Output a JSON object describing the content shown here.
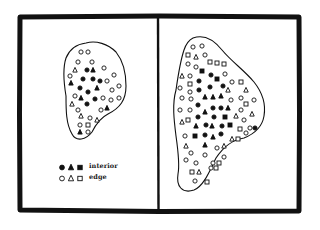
{
  "figure": {
    "frame": {
      "outer": {
        "x": 20,
        "y": 16,
        "w": 279,
        "h": 195
      },
      "divider_x": 158,
      "stroke": "#111111",
      "stroke_width": 5
    },
    "panels": [
      {
        "id": "left",
        "blob_path": "M86,43 C96,40 108,44 116,52 C124,62 126,74 126,86 C126,100 120,108 108,114 C100,118 96,124 92,132 C86,140 76,142 72,134 C66,124 66,110 66,96 C64,84 62,70 66,58 C70,48 78,44 86,43 Z",
        "markers": [
          {
            "x": 81,
            "y": 52,
            "shape": "circle",
            "fill": false
          },
          {
            "x": 88,
            "y": 52,
            "shape": "circle",
            "fill": false
          },
          {
            "x": 78,
            "y": 62,
            "shape": "circle",
            "fill": false
          },
          {
            "x": 92,
            "y": 62,
            "shape": "circle",
            "fill": false
          },
          {
            "x": 75,
            "y": 70,
            "shape": "triangle",
            "fill": false
          },
          {
            "x": 87,
            "y": 70,
            "shape": "circle",
            "fill": true
          },
          {
            "x": 93,
            "y": 70,
            "shape": "triangle",
            "fill": true
          },
          {
            "x": 104,
            "y": 68,
            "shape": "circle",
            "fill": false
          },
          {
            "x": 70,
            "y": 76,
            "shape": "circle",
            "fill": false
          },
          {
            "x": 83,
            "y": 79,
            "shape": "circle",
            "fill": true
          },
          {
            "x": 93,
            "y": 79,
            "shape": "circle",
            "fill": true
          },
          {
            "x": 100,
            "y": 81,
            "shape": "circle",
            "fill": true
          },
          {
            "x": 107,
            "y": 81,
            "shape": "circle",
            "fill": false
          },
          {
            "x": 114,
            "y": 75,
            "shape": "circle",
            "fill": false
          },
          {
            "x": 71,
            "y": 83,
            "shape": "triangle",
            "fill": true
          },
          {
            "x": 80,
            "y": 88,
            "shape": "circle",
            "fill": true
          },
          {
            "x": 97,
            "y": 88,
            "shape": "triangle",
            "fill": true
          },
          {
            "x": 112,
            "y": 90,
            "shape": "circle",
            "fill": false
          },
          {
            "x": 119,
            "y": 86,
            "shape": "circle",
            "fill": false
          },
          {
            "x": 88,
            "y": 92,
            "shape": "circle",
            "fill": true
          },
          {
            "x": 75,
            "y": 96,
            "shape": "circle",
            "fill": false
          },
          {
            "x": 81,
            "y": 98,
            "shape": "triangle",
            "fill": true
          },
          {
            "x": 95,
            "y": 99,
            "shape": "circle",
            "fill": true
          },
          {
            "x": 103,
            "y": 98,
            "shape": "circle",
            "fill": false
          },
          {
            "x": 111,
            "y": 100,
            "shape": "circle",
            "fill": false
          },
          {
            "x": 119,
            "y": 98,
            "shape": "circle",
            "fill": false
          },
          {
            "x": 72,
            "y": 104,
            "shape": "triangle",
            "fill": false
          },
          {
            "x": 87,
            "y": 104,
            "shape": "circle",
            "fill": true
          },
          {
            "x": 78,
            "y": 110,
            "shape": "circle",
            "fill": false
          },
          {
            "x": 101,
            "y": 110,
            "shape": "circle",
            "fill": false
          },
          {
            "x": 107,
            "y": 108,
            "shape": "triangle",
            "fill": true
          },
          {
            "x": 81,
            "y": 116,
            "shape": "triangle",
            "fill": false
          },
          {
            "x": 90,
            "y": 118,
            "shape": "circle",
            "fill": false
          },
          {
            "x": 97,
            "y": 120,
            "shape": "triangle",
            "fill": false
          },
          {
            "x": 80,
            "y": 125,
            "shape": "circle",
            "fill": false
          },
          {
            "x": 88,
            "y": 125,
            "shape": "square",
            "fill": false
          },
          {
            "x": 80,
            "y": 132,
            "shape": "triangle",
            "fill": true
          },
          {
            "x": 88,
            "y": 132,
            "shape": "circle",
            "fill": false
          }
        ]
      },
      {
        "id": "right",
        "blob_path": "M193,38 C204,34 214,40 222,50 C232,62 244,70 254,82 C262,92 266,104 264,116 C262,128 254,134 244,138 C232,140 224,146 216,158 C210,170 204,186 194,190 C182,194 176,186 178,174 C180,164 178,150 176,136 C174,120 172,104 176,90 C178,76 180,62 184,50 C186,44 189,40 193,38 Z",
        "markers": [
          {
            "x": 193,
            "y": 47,
            "shape": "circle",
            "fill": false
          },
          {
            "x": 202,
            "y": 46,
            "shape": "circle",
            "fill": false
          },
          {
            "x": 188,
            "y": 55,
            "shape": "square",
            "fill": false
          },
          {
            "x": 196,
            "y": 57,
            "shape": "triangle",
            "fill": false
          },
          {
            "x": 205,
            "y": 55,
            "shape": "circle",
            "fill": false
          },
          {
            "x": 188,
            "y": 64,
            "shape": "circle",
            "fill": false
          },
          {
            "x": 196,
            "y": 67,
            "shape": "circle",
            "fill": false
          },
          {
            "x": 210,
            "y": 62,
            "shape": "square",
            "fill": false
          },
          {
            "x": 217,
            "y": 63,
            "shape": "square",
            "fill": false
          },
          {
            "x": 224,
            "y": 64,
            "shape": "square",
            "fill": false
          },
          {
            "x": 182,
            "y": 76,
            "shape": "triangle",
            "fill": false
          },
          {
            "x": 190,
            "y": 76,
            "shape": "circle",
            "fill": false
          },
          {
            "x": 202,
            "y": 71,
            "shape": "square",
            "fill": true
          },
          {
            "x": 211,
            "y": 75,
            "shape": "circle",
            "fill": true
          },
          {
            "x": 217,
            "y": 79,
            "shape": "square",
            "fill": true
          },
          {
            "x": 225,
            "y": 74,
            "shape": "circle",
            "fill": false
          },
          {
            "x": 180,
            "y": 88,
            "shape": "circle",
            "fill": false
          },
          {
            "x": 190,
            "y": 84,
            "shape": "square",
            "fill": false
          },
          {
            "x": 199,
            "y": 81,
            "shape": "circle",
            "fill": true
          },
          {
            "x": 210,
            "y": 87,
            "shape": "circle",
            "fill": true
          },
          {
            "x": 223,
            "y": 86,
            "shape": "circle",
            "fill": true
          },
          {
            "x": 232,
            "y": 82,
            "shape": "circle",
            "fill": false
          },
          {
            "x": 241,
            "y": 82,
            "shape": "square",
            "fill": false
          },
          {
            "x": 190,
            "y": 92,
            "shape": "circle",
            "fill": false
          },
          {
            "x": 199,
            "y": 90,
            "shape": "circle",
            "fill": true
          },
          {
            "x": 228,
            "y": 90,
            "shape": "triangle",
            "fill": false
          },
          {
            "x": 246,
            "y": 90,
            "shape": "triangle",
            "fill": false
          },
          {
            "x": 182,
            "y": 98,
            "shape": "circle",
            "fill": false
          },
          {
            "x": 191,
            "y": 99,
            "shape": "circle",
            "fill": false
          },
          {
            "x": 205,
            "y": 97,
            "shape": "triangle",
            "fill": true
          },
          {
            "x": 213,
            "y": 97,
            "shape": "triangle",
            "fill": true
          },
          {
            "x": 221,
            "y": 96,
            "shape": "triangle",
            "fill": true
          },
          {
            "x": 231,
            "y": 100,
            "shape": "circle",
            "fill": false
          },
          {
            "x": 241,
            "y": 98,
            "shape": "circle",
            "fill": false
          },
          {
            "x": 254,
            "y": 100,
            "shape": "circle",
            "fill": false
          },
          {
            "x": 198,
            "y": 105,
            "shape": "circle",
            "fill": true
          },
          {
            "x": 246,
            "y": 104,
            "shape": "square",
            "fill": false
          },
          {
            "x": 180,
            "y": 110,
            "shape": "circle",
            "fill": false
          },
          {
            "x": 190,
            "y": 110,
            "shape": "circle",
            "fill": false
          },
          {
            "x": 205,
            "y": 112,
            "shape": "triangle",
            "fill": true
          },
          {
            "x": 213,
            "y": 108,
            "shape": "circle",
            "fill": true
          },
          {
            "x": 221,
            "y": 108,
            "shape": "circle",
            "fill": true
          },
          {
            "x": 228,
            "y": 108,
            "shape": "triangle",
            "fill": true
          },
          {
            "x": 241,
            "y": 110,
            "shape": "circle",
            "fill": false
          },
          {
            "x": 252,
            "y": 114,
            "shape": "triangle",
            "fill": false
          },
          {
            "x": 182,
            "y": 122,
            "shape": "triangle",
            "fill": false
          },
          {
            "x": 188,
            "y": 120,
            "shape": "square",
            "fill": false
          },
          {
            "x": 198,
            "y": 117,
            "shape": "circle",
            "fill": true
          },
          {
            "x": 214,
            "y": 117,
            "shape": "circle",
            "fill": true
          },
          {
            "x": 225,
            "y": 117,
            "shape": "square",
            "fill": true
          },
          {
            "x": 236,
            "y": 116,
            "shape": "triangle",
            "fill": false
          },
          {
            "x": 244,
            "y": 120,
            "shape": "circle",
            "fill": false
          },
          {
            "x": 196,
            "y": 126,
            "shape": "triangle",
            "fill": true
          },
          {
            "x": 206,
            "y": 125,
            "shape": "circle",
            "fill": true
          },
          {
            "x": 212,
            "y": 126,
            "shape": "triangle",
            "fill": true
          },
          {
            "x": 222,
            "y": 126,
            "shape": "circle",
            "fill": true
          },
          {
            "x": 230,
            "y": 125,
            "shape": "square",
            "fill": true
          },
          {
            "x": 240,
            "y": 129,
            "shape": "square",
            "fill": false
          },
          {
            "x": 250,
            "y": 128,
            "shape": "circle",
            "fill": false
          },
          {
            "x": 185,
            "y": 136,
            "shape": "circle",
            "fill": false
          },
          {
            "x": 195,
            "y": 136,
            "shape": "square",
            "fill": true
          },
          {
            "x": 205,
            "y": 135,
            "shape": "circle",
            "fill": true
          },
          {
            "x": 213,
            "y": 137,
            "shape": "triangle",
            "fill": true
          },
          {
            "x": 221,
            "y": 134,
            "shape": "circle",
            "fill": true
          },
          {
            "x": 232,
            "y": 139,
            "shape": "triangle",
            "fill": false
          },
          {
            "x": 238,
            "y": 139,
            "shape": "square",
            "fill": false
          },
          {
            "x": 246,
            "y": 133,
            "shape": "circle",
            "fill": false
          },
          {
            "x": 255,
            "y": 128,
            "shape": "circle",
            "fill": true
          },
          {
            "x": 186,
            "y": 146,
            "shape": "triangle",
            "fill": false
          },
          {
            "x": 205,
            "y": 145,
            "shape": "triangle",
            "fill": true
          },
          {
            "x": 217,
            "y": 148,
            "shape": "circle",
            "fill": false
          },
          {
            "x": 224,
            "y": 146,
            "shape": "triangle",
            "fill": false
          },
          {
            "x": 191,
            "y": 153,
            "shape": "circle",
            "fill": false
          },
          {
            "x": 205,
            "y": 155,
            "shape": "circle",
            "fill": false
          },
          {
            "x": 186,
            "y": 160,
            "shape": "circle",
            "fill": false
          },
          {
            "x": 196,
            "y": 163,
            "shape": "circle",
            "fill": false
          },
          {
            "x": 213,
            "y": 163,
            "shape": "circle",
            "fill": false
          },
          {
            "x": 219,
            "y": 163,
            "shape": "square",
            "fill": false
          },
          {
            "x": 224,
            "y": 157,
            "shape": "circle",
            "fill": false
          },
          {
            "x": 192,
            "y": 172,
            "shape": "square",
            "fill": false
          },
          {
            "x": 199,
            "y": 172,
            "shape": "triangle",
            "fill": false
          },
          {
            "x": 211,
            "y": 168,
            "shape": "circle",
            "fill": false
          },
          {
            "x": 216,
            "y": 168,
            "shape": "square",
            "fill": false
          },
          {
            "x": 195,
            "y": 181,
            "shape": "circle",
            "fill": false
          },
          {
            "x": 207,
            "y": 182,
            "shape": "square",
            "fill": false
          }
        ]
      }
    ],
    "legend": {
      "items": [
        {
          "label": "interior",
          "fill": true
        },
        {
          "label": "edge",
          "fill": false
        }
      ]
    },
    "colors": {
      "ink": "#111111",
      "background": "#ffffff"
    }
  }
}
